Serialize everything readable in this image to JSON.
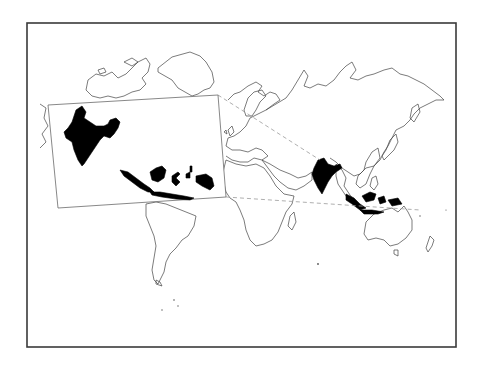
{
  "map": {
    "title": "World map highlighting India and Indonesia",
    "projection": "world outline (Pacific-cropped)",
    "highlighted_regions": [
      "India",
      "Indonesia"
    ],
    "highlight_color": "#000000",
    "outline_color": "#444444",
    "background_color": "#ffffff",
    "frame_color": "#3a3a3a",
    "inset": {
      "label": "Inset: India and Indonesia (enlarged)",
      "regions": [
        "India",
        "Indonesia"
      ]
    },
    "leader_lines": {
      "style": "dashed",
      "color": "#9a9a9a",
      "count": 2
    },
    "continents_outlined": [
      "North America",
      "Greenland",
      "South America",
      "Europe",
      "Africa",
      "Asia",
      "Australia",
      "New Zealand"
    ]
  }
}
